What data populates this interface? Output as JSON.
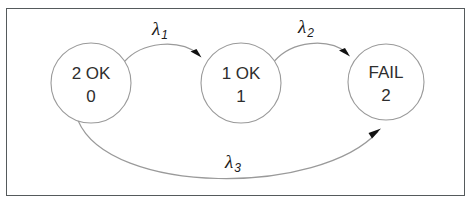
{
  "diagram": {
    "frame": {
      "border_color": "#555a5c",
      "background_color": "#ffffff"
    },
    "style": {
      "circle_stroke_color": "#9a9a9a",
      "arrow_stroke_color": "#9a9a9a",
      "arrow_head_color": "#111111",
      "text_color": "#2e2e2e"
    },
    "states": [
      {
        "id": "state-2ok",
        "line1": "2 OK",
        "line2": "0",
        "cx": 91,
        "cy": 83,
        "r": 40
      },
      {
        "id": "state-1ok",
        "line1": "1 OK",
        "line2": "1",
        "cx": 241,
        "cy": 83,
        "r": 40
      },
      {
        "id": "state-fail",
        "line1": "FAIL",
        "line2": "2",
        "cx": 386,
        "cy": 82,
        "r": 38
      }
    ],
    "transitions": [
      {
        "id": "transition-lambda-1",
        "from": "state-2ok",
        "to": "state-1ok",
        "greek": "λ",
        "subscript": "1",
        "label_x": 160,
        "label_y": 35
      },
      {
        "id": "transition-lambda-2",
        "from": "state-1ok",
        "to": "state-fail",
        "greek": "λ",
        "subscript": "2",
        "label_x": 306,
        "label_y": 33
      },
      {
        "id": "transition-lambda-3",
        "from": "state-2ok",
        "to": "state-fail",
        "greek": "λ",
        "subscript": "3",
        "label_x": 233,
        "label_y": 168
      }
    ]
  }
}
